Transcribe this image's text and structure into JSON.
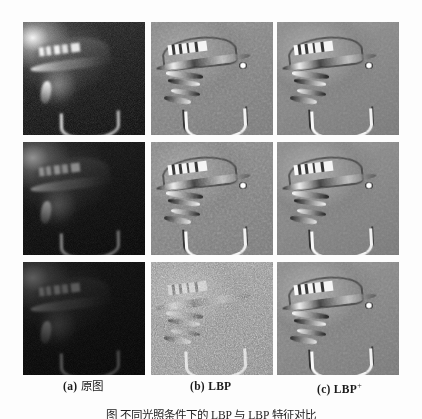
{
  "figure": {
    "background_color": "#fdfdfd",
    "grid": {
      "rows": 3,
      "columns": 3,
      "cell_width": 122,
      "cell_height": 113
    },
    "columns": [
      {
        "id": "a",
        "tag": "(a)",
        "label": "原图",
        "kind": "original",
        "description": "grayscale face photo of a person wearing a lettered cap, progressively lower illumination down the rows"
      },
      {
        "id": "b",
        "tag": "(b)",
        "label": "LBP",
        "kind": "lbp",
        "description": "local binary pattern texture map, mid-gray with binary edge responses"
      },
      {
        "id": "c",
        "tag": "(c)",
        "label": "LBP",
        "label_superscript": "+",
        "kind": "lbp-plus",
        "description": "improved local binary pattern texture map with higher contrast and cleaner structure"
      }
    ],
    "rows": [
      {
        "id": "row-1",
        "illumination": "normal",
        "lbp_noise": "low"
      },
      {
        "id": "row-2",
        "illumination": "reduced",
        "lbp_noise": "low"
      },
      {
        "id": "row-3",
        "illumination": "very-low / dark",
        "lbp_noise": "high"
      }
    ],
    "caption": "图  不同光照条件下的 LBP 与 LBP 特征对比",
    "caption_clipped": true
  }
}
